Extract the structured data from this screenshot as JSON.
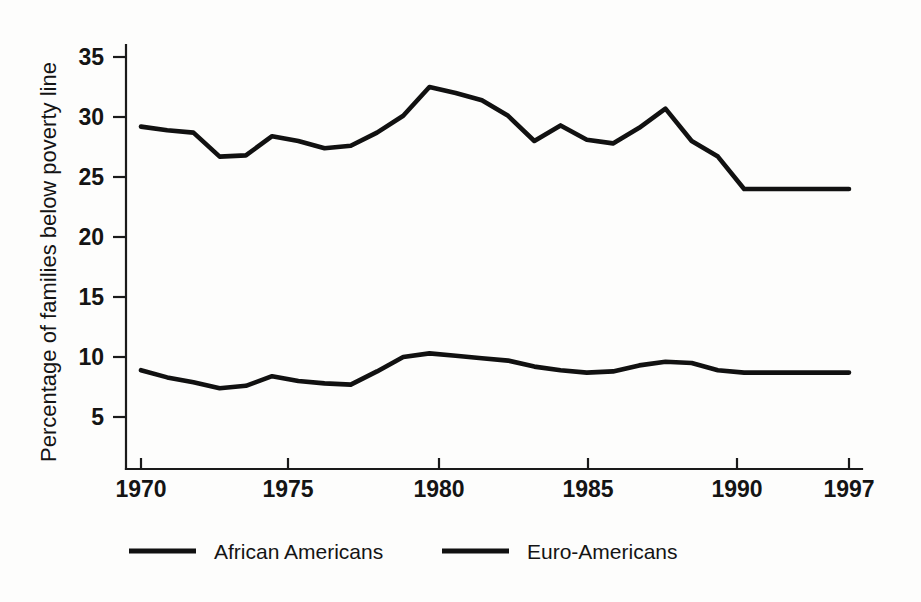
{
  "chart_data": {
    "type": "line",
    "title": "",
    "subtitle": "",
    "xlabel": "",
    "ylabel": "Percentage of families below poverty line",
    "xlim": [
      1970,
      1997
    ],
    "ylim": [
      0,
      36
    ],
    "x_ticks": [
      1970,
      1975,
      1980,
      1985,
      1990,
      1997
    ],
    "x_tick_labels": [
      "1970",
      "1975",
      "1980",
      "1985",
      "1990",
      "1997"
    ],
    "y_ticks": [
      5,
      10,
      15,
      20,
      25,
      30,
      35
    ],
    "y_tick_labels": [
      "5",
      "10",
      "15",
      "20",
      "25",
      "30",
      "35"
    ],
    "grid": false,
    "legend_position": "bottom",
    "x": [
      1970,
      1971,
      1972,
      1973,
      1974,
      1975,
      1976,
      1977,
      1978,
      1979,
      1980,
      1981,
      1982,
      1983,
      1984,
      1985,
      1986,
      1987,
      1988,
      1989,
      1990,
      1991,
      1992,
      1993,
      1997
    ],
    "series": [
      {
        "name": "African Americans",
        "color": "#111111",
        "values": [
          29.2,
          28.9,
          28.7,
          26.7,
          26.8,
          28.4,
          28.0,
          27.4,
          27.6,
          28.7,
          30.1,
          32.5,
          32.0,
          31.4,
          30.1,
          28.0,
          29.3,
          28.1,
          27.8,
          29.1,
          30.7,
          28.0,
          26.7,
          24.0,
          24.0
        ]
      },
      {
        "name": "Euro-Americans",
        "color": "#111111",
        "values": [
          8.9,
          8.3,
          7.9,
          7.4,
          7.6,
          8.4,
          8.0,
          7.8,
          7.7,
          8.8,
          10.0,
          10.3,
          10.1,
          9.9,
          9.7,
          9.2,
          8.9,
          8.7,
          8.8,
          9.3,
          9.6,
          9.5,
          8.9,
          8.7,
          8.7
        ]
      }
    ],
    "annotations": []
  },
  "legend": {
    "items": [
      {
        "label": "African Americans"
      },
      {
        "label": "Euro-Americans"
      }
    ]
  },
  "axes": {
    "y_axis_label": "Percentage of families below poverty line",
    "x_axis_label": ""
  }
}
